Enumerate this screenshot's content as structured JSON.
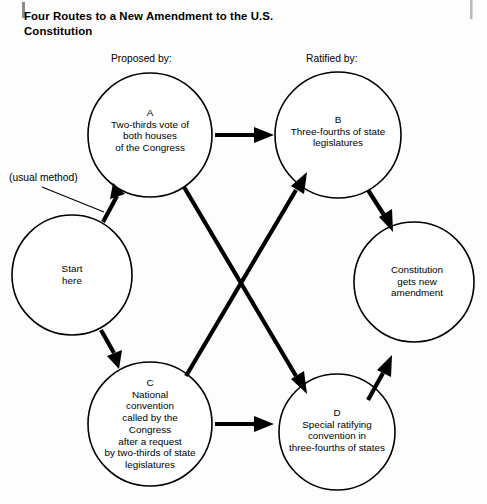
{
  "title": {
    "line1": "Four Routes to a New Amendment",
    "line2": "to the U.S. Constitution"
  },
  "headers": {
    "proposed": "Proposed by:",
    "ratified": "Ratified by:"
  },
  "annotations": {
    "usual_method": "(usual method)"
  },
  "diagram": {
    "type": "flow-diagram",
    "nodes": [
      {
        "id": "start",
        "name": "start-here",
        "cx": 72,
        "cy": 275,
        "r": 60,
        "lines": [
          "Start",
          "here"
        ]
      },
      {
        "id": "A",
        "name": "node-a-congress-vote",
        "cx": 150,
        "cy": 135,
        "r": 62,
        "lines": [
          "A",
          "Two-thirds vote of",
          "both houses",
          "of the Congress"
        ]
      },
      {
        "id": "B",
        "name": "node-b-state-legislatures",
        "cx": 338,
        "cy": 135,
        "r": 63,
        "lines": [
          "B",
          "Three-fourths of state",
          "legislatures"
        ]
      },
      {
        "id": "C",
        "name": "node-c-national-convention",
        "cx": 150,
        "cy": 424,
        "r": 62,
        "lines": [
          "C",
          "National",
          "convention",
          "called by the",
          "Congress",
          "after a request",
          "by two-thirds of state",
          "legislatures"
        ]
      },
      {
        "id": "D",
        "name": "node-d-ratifying-convention",
        "cx": 337,
        "cy": 432,
        "r": 58,
        "lines": [
          "D",
          "Special ratifying",
          "convention in",
          "three-fourths of states"
        ]
      },
      {
        "id": "result",
        "name": "node-result-constitution",
        "cx": 414,
        "cy": 282,
        "r": 60,
        "lines": [
          "Constitution",
          "gets new",
          "amendment"
        ]
      }
    ],
    "edges": [
      {
        "name": "edge-start-to-a",
        "from": "start",
        "to": "A"
      },
      {
        "name": "edge-start-to-c",
        "from": "start",
        "to": "C"
      },
      {
        "name": "edge-a-to-b",
        "from": "A",
        "to": "B"
      },
      {
        "name": "edge-a-to-d",
        "from": "A",
        "to": "D"
      },
      {
        "name": "edge-c-to-b",
        "from": "C",
        "to": "B"
      },
      {
        "name": "edge-c-to-d",
        "from": "C",
        "to": "D"
      },
      {
        "name": "edge-b-to-result",
        "from": "B",
        "to": "result"
      },
      {
        "name": "edge-d-to-result",
        "from": "D",
        "to": "result"
      }
    ],
    "colors": {
      "stroke": "#000000",
      "fill": "#ffffff",
      "background": "#fdfdfd"
    }
  }
}
